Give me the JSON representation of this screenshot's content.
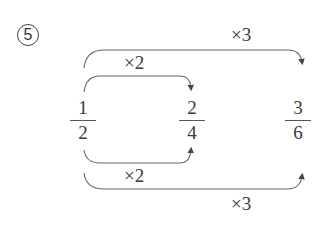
{
  "problem_number": "5",
  "fractions": [
    {
      "numerator": "1",
      "denominator": "2"
    },
    {
      "numerator": "2",
      "denominator": "4"
    },
    {
      "numerator": "3",
      "denominator": "6"
    }
  ],
  "arrows": {
    "top_outer": "×3",
    "top_inner": "×2",
    "bottom_inner": "×2",
    "bottom_outer": "×3"
  },
  "colors": {
    "line": "#555555",
    "text": "#3a3a3a"
  }
}
